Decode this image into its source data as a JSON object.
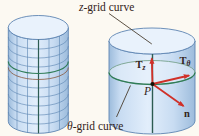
{
  "colors": {
    "bg": "#fcf9f2",
    "cylinder_light": "#e2eefb",
    "cylinder_mid": "#c8dcf2",
    "cylinder_dark": "#9dbcdc",
    "cylinder_stroke": "#5d85b2",
    "grid_line": "#5f87b4",
    "inner_top": "#e9f2fc",
    "green_curve": "#2f7c57",
    "disk_rim": "#76a28c",
    "brown_curve": "#8a5a40",
    "dark_z_curve": "#2d5c52",
    "arrow_red": "#d03028",
    "text_dark": "#33231a",
    "leader_line": "#4a3e30",
    "point_black": "#141008"
  },
  "labels": {
    "z_symbol": "z",
    "theta_symbol": "θ",
    "grid_suffix": "-grid curve"
  },
  "point": {
    "label": "P"
  },
  "vectors": {
    "tz": {
      "main": "T",
      "sub": "z"
    },
    "ttheta": {
      "main": "T",
      "sub": "θ"
    },
    "normal": {
      "label": "n"
    }
  }
}
